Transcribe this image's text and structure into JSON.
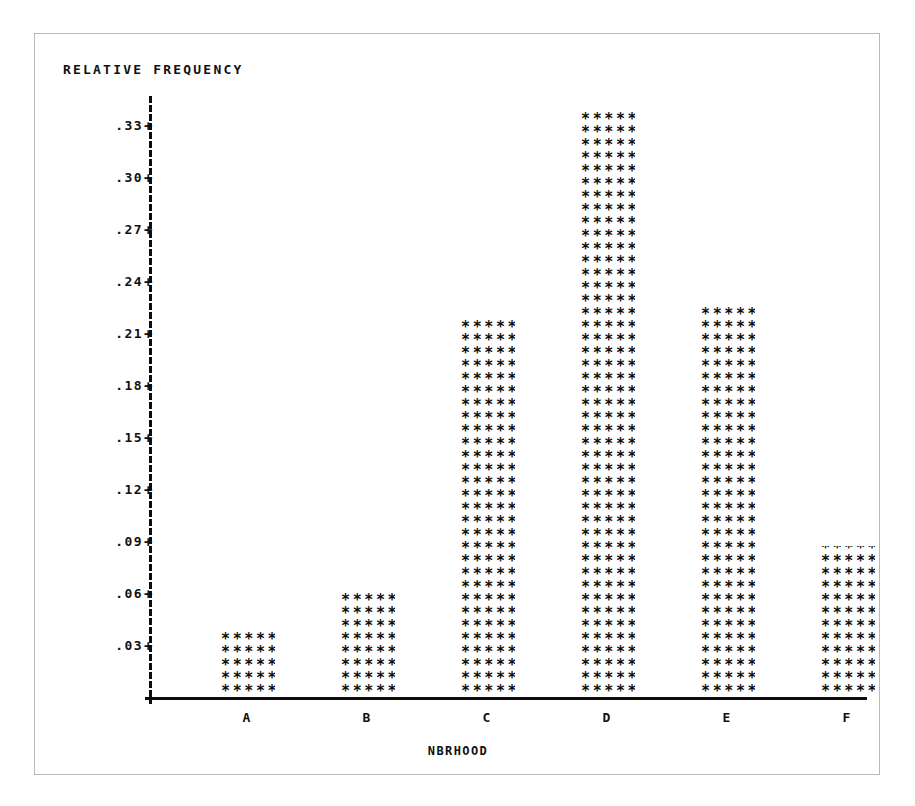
{
  "chart_data": {
    "type": "bar",
    "title": "RELATIVE FREQUENCY",
    "xlabel": "NBRHOOD",
    "ylabel": "RELATIVE FREQUENCY",
    "categories": [
      "A",
      "B",
      "C",
      "D",
      "E",
      "F"
    ],
    "values": [
      0.038,
      0.061,
      0.225,
      0.348,
      0.236,
      0.088
    ],
    "ytick_labels": [
      ".33",
      ".30",
      ".27",
      ".24",
      ".21",
      ".18",
      ".15",
      ".12",
      ".09",
      ".06",
      ".03"
    ],
    "ytick_values": [
      0.33,
      0.3,
      0.27,
      0.24,
      0.21,
      0.18,
      0.15,
      0.12,
      0.09,
      0.06,
      0.03
    ],
    "ylim": [
      0,
      0.36
    ],
    "grid": false,
    "legend": null,
    "bar_fill_glyph": "*",
    "bar_glyphs_per_row": 5,
    "bar_rows": [
      5,
      8,
      29,
      45,
      30,
      12
    ],
    "style_note": "line-printer ASCII plot"
  },
  "axis": {
    "tick_mark_glyph": "+"
  },
  "colors": {
    "ink": "#0d0d0d",
    "frame": "#b9b9b9",
    "background": "#ffffff"
  }
}
